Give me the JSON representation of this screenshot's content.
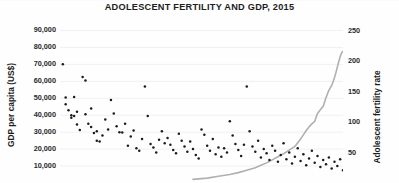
{
  "chart_data": {
    "type": "scatter",
    "title": "ADOLESCENT FERTILITY AND GDP, 2015",
    "xlabel": "",
    "ylabel": "GDP per capita (US$)",
    "y2label": "Adolescent fertility rate",
    "grid": true,
    "legend": "none",
    "y_left": {
      "label": "GDP per capita (US$)",
      "ticks": [
        "10,000",
        "20,000",
        "30,000",
        "40,000",
        "50,000",
        "60,000",
        "70,000",
        "80,000",
        "90,000"
      ],
      "tick_values": [
        10000,
        20000,
        30000,
        40000,
        50000,
        60000,
        70000,
        80000,
        90000
      ],
      "ylim": [
        0,
        95000
      ]
    },
    "y_right": {
      "label": "Adolescent fertility rate",
      "ticks": [
        "50",
        "100",
        "150",
        "200",
        "250"
      ],
      "tick_values": [
        50,
        100,
        150,
        200,
        250
      ],
      "ylim": [
        0,
        264
      ]
    },
    "series": [
      {
        "name": "GDP per capita (US$)",
        "type": "scatter",
        "axis": "left",
        "marker": "dot",
        "color": "#1c1c1c",
        "points": [
          [
            1,
            70000
          ],
          [
            2,
            50500
          ],
          [
            2,
            46500
          ],
          [
            3,
            43000
          ],
          [
            4,
            40000
          ],
          [
            4,
            38500
          ],
          [
            5,
            50800
          ],
          [
            5,
            39500
          ],
          [
            6,
            42000
          ],
          [
            6,
            34500
          ],
          [
            7,
            31200
          ],
          [
            8,
            62500
          ],
          [
            9,
            60500
          ],
          [
            9,
            40500
          ],
          [
            10,
            35000
          ],
          [
            11,
            44000
          ],
          [
            11,
            33000
          ],
          [
            12,
            29500
          ],
          [
            13,
            30500
          ],
          [
            13,
            25000
          ],
          [
            14,
            24500
          ],
          [
            15,
            28000
          ],
          [
            16,
            37500
          ],
          [
            17,
            31500
          ],
          [
            18,
            49000
          ],
          [
            19,
            41000
          ],
          [
            20,
            33500
          ],
          [
            21,
            30000
          ],
          [
            22,
            29800
          ],
          [
            23,
            35000
          ],
          [
            24,
            22000
          ],
          [
            25,
            27500
          ],
          [
            26,
            31000
          ],
          [
            27,
            20500
          ],
          [
            28,
            19000
          ],
          [
            29,
            26000
          ],
          [
            30,
            57000
          ],
          [
            31,
            39500
          ],
          [
            32,
            23000
          ],
          [
            33,
            21000
          ],
          [
            34,
            18000
          ],
          [
            35,
            25500
          ],
          [
            36,
            30500
          ],
          [
            37,
            23500
          ],
          [
            38,
            26500
          ],
          [
            39,
            22500
          ],
          [
            40,
            19500
          ],
          [
            41,
            17500
          ],
          [
            42,
            29000
          ],
          [
            43,
            25000
          ],
          [
            44,
            21500
          ],
          [
            45,
            18500
          ],
          [
            46,
            24500
          ],
          [
            47,
            20000
          ],
          [
            48,
            16500
          ],
          [
            49,
            14500
          ],
          [
            50,
            31500
          ],
          [
            51,
            28500
          ],
          [
            52,
            22000
          ],
          [
            53,
            19000
          ],
          [
            54,
            26000
          ],
          [
            55,
            17000
          ],
          [
            56,
            21000
          ],
          [
            57,
            15500
          ],
          [
            58,
            20500
          ],
          [
            59,
            18000
          ],
          [
            60,
            36500
          ],
          [
            61,
            28000
          ],
          [
            62,
            23000
          ],
          [
            63,
            19500
          ],
          [
            64,
            16000
          ],
          [
            65,
            22500
          ],
          [
            66,
            57000
          ],
          [
            67,
            30500
          ],
          [
            68,
            21500
          ],
          [
            69,
            18500
          ],
          [
            70,
            25000
          ],
          [
            71,
            15000
          ],
          [
            72,
            20000
          ],
          [
            73,
            17500
          ],
          [
            74,
            13500
          ],
          [
            75,
            22000
          ],
          [
            76,
            19000
          ],
          [
            77,
            12500
          ],
          [
            78,
            16500
          ],
          [
            79,
            23500
          ],
          [
            80,
            14000
          ],
          [
            81,
            18000
          ],
          [
            82,
            11500
          ],
          [
            83,
            15500
          ],
          [
            84,
            20500
          ],
          [
            85,
            13000
          ],
          [
            86,
            17000
          ],
          [
            87,
            10500
          ],
          [
            88,
            14500
          ],
          [
            89,
            19000
          ],
          [
            90,
            12000
          ],
          [
            91,
            16000
          ],
          [
            92,
            9500
          ],
          [
            93,
            13500
          ],
          [
            94,
            11000
          ],
          [
            95,
            15000
          ],
          [
            96,
            8500
          ],
          [
            97,
            12500
          ],
          [
            98,
            10000
          ],
          [
            99,
            14000
          ],
          [
            100,
            7500
          ]
        ]
      },
      {
        "name": "Adolescent fertility rate",
        "type": "line",
        "axis": "right",
        "color": "#b0b0b0",
        "points": [
          [
            47,
            6
          ],
          [
            52,
            8
          ],
          [
            56,
            11
          ],
          [
            60,
            14
          ],
          [
            63,
            17
          ],
          [
            66,
            21
          ],
          [
            69,
            25
          ],
          [
            71,
            29
          ],
          [
            73,
            33
          ],
          [
            75,
            38
          ],
          [
            77,
            43
          ],
          [
            79,
            48
          ],
          [
            81,
            54
          ],
          [
            83,
            60
          ],
          [
            84,
            66
          ],
          [
            85,
            72
          ],
          [
            86,
            79
          ],
          [
            87,
            86
          ],
          [
            88,
            92
          ],
          [
            89,
            97
          ],
          [
            90,
            101
          ],
          [
            90.5,
            108
          ],
          [
            91,
            114
          ],
          [
            92,
            120
          ],
          [
            93,
            126
          ],
          [
            93.5,
            133
          ],
          [
            94,
            140
          ],
          [
            94.5,
            146
          ],
          [
            95,
            152
          ],
          [
            95.5,
            156
          ],
          [
            96,
            160
          ],
          [
            96.5,
            166
          ],
          [
            97,
            173
          ],
          [
            97.5,
            181
          ],
          [
            98,
            190
          ],
          [
            98.5,
            199
          ],
          [
            99,
            207
          ],
          [
            99.3,
            211
          ],
          [
            99.6,
            214
          ],
          [
            100,
            216
          ]
        ]
      }
    ]
  },
  "title": {
    "text": "ADOLESCENT FERTILITY AND GDP, 2015"
  },
  "axes": {
    "left": {
      "title": "GDP per capita (US$)",
      "ticks": [
        "90,000",
        "80,000",
        "70,000",
        "60,000",
        "50,000",
        "40,000",
        "30,000",
        "20,000",
        "10,000"
      ]
    },
    "right": {
      "title": "Adolescent fertility rate",
      "ticks": [
        "250",
        "200",
        "150",
        "100",
        "50"
      ]
    }
  },
  "colors": {
    "marker": "#1c1c1c",
    "line": "#b4b4b4",
    "grid": "#f0f0f0",
    "text": "#1d1d1d",
    "background": "#ffffff"
  }
}
